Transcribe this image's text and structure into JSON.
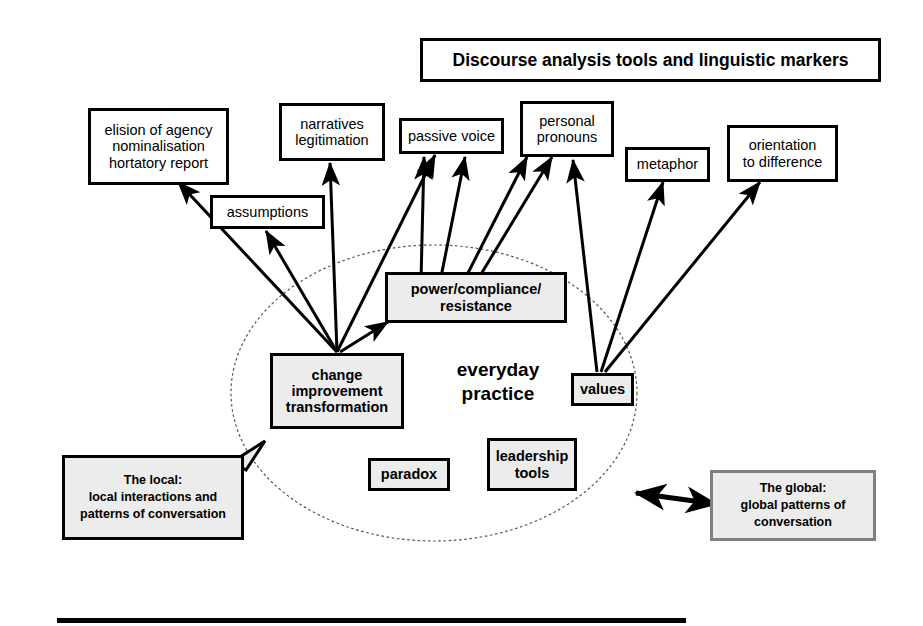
{
  "title": {
    "text": "Discourse analysis tools and linguistic markers"
  },
  "center_label": {
    "line1": "everyday",
    "line2": "practice"
  },
  "marker_nodes": [
    {
      "id": "elision",
      "text": "elision of agency\nnominalisation\nhortatory report"
    },
    {
      "id": "narratives",
      "text": "narratives\nlegitimation"
    },
    {
      "id": "passive",
      "text": "passive voice"
    },
    {
      "id": "pronouns",
      "text": "personal\npronouns"
    },
    {
      "id": "metaphor",
      "text": "metaphor"
    },
    {
      "id": "orientation",
      "text": "orientation\nto difference"
    },
    {
      "id": "assumptions",
      "text": "assumptions"
    }
  ],
  "practice_nodes": [
    {
      "id": "power",
      "text": "power/compliance/\nresistance"
    },
    {
      "id": "change",
      "text": "change\nimprovement\ntransformation"
    },
    {
      "id": "values",
      "text": "values"
    },
    {
      "id": "paradox",
      "text": "paradox"
    },
    {
      "id": "leadership",
      "text": "leadership\ntools"
    }
  ],
  "callouts": {
    "local": {
      "text": "The local:\nlocal interactions and\npatterns of conversation"
    },
    "global": {
      "text": "The global:\nglobal patterns of\nconversation"
    }
  },
  "colors": {
    "stroke": "#000000",
    "node_fill_white": "#ffffff",
    "node_fill_gray": "#ececec",
    "global_border": "#808080",
    "ellipse_stroke": "#555555"
  }
}
